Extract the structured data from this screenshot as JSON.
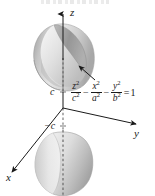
{
  "figure": {
    "surface_type": "hyperboloid-of-two-sheets",
    "background_color": "#ffffff",
    "ink_color": "#1a1a1a",
    "surface_fill_light": "#f2f2f2",
    "surface_fill_mid": "#d6d6d6",
    "surface_fill_dark": "#9a9a9a"
  },
  "axes": {
    "z": {
      "label": "z",
      "direction": "up"
    },
    "y": {
      "label": "y",
      "direction": "right"
    },
    "x": {
      "label": "x",
      "direction": "lower-left"
    }
  },
  "ticks": [
    {
      "name": "positive-c",
      "label": "c",
      "axis": "z"
    },
    {
      "name": "negative-c",
      "label": "−c",
      "axis": "z"
    }
  ],
  "equation": {
    "full_text": "z²/c² − x²/a² − y²/b² = 1",
    "terms": [
      {
        "numerator": "z",
        "numerator_exp": "2",
        "denominator": "c",
        "denominator_exp": "2"
      },
      {
        "numerator": "x",
        "numerator_exp": "2",
        "denominator": "a",
        "denominator_exp": "2"
      },
      {
        "numerator": "y",
        "numerator_exp": "2",
        "denominator": "b",
        "denominator_exp": "2"
      }
    ],
    "operators": [
      "−",
      "−"
    ],
    "relation": "=",
    "right_hand_side": "1"
  },
  "annotations": [
    {
      "name": "leader-arrow",
      "points_to": "upper-sheet-surface"
    }
  ],
  "sheets": [
    {
      "name": "upper-sheet",
      "position": "above z = c"
    },
    {
      "name": "lower-sheet",
      "position": "below z = −c"
    }
  ],
  "top_artifact": {
    "description": "cropped text remnant from line above figure"
  }
}
